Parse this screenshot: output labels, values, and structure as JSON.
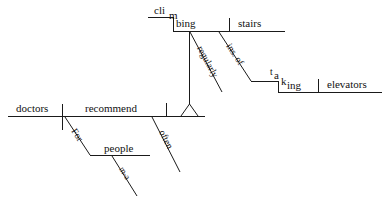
{
  "diagram": {
    "type": "reed-kellogg-sentence-diagram",
    "sentence": "Doctors often recommend climbing stairs regularly instead of taking elevators for middle-aged people.",
    "ink_color": "#1a1a1a",
    "background_color": "#ffffff",
    "main_clause": {
      "subject": "doctors",
      "verb": "recommend",
      "subject_verb_divider": "vertical-crossing-baseline"
    },
    "direct_object_phrase": {
      "gerund": {
        "prefix": "cli",
        "mid": "m",
        "suffix": "bing",
        "full": "climbing"
      },
      "object": "stairs",
      "object_divider": "vertical-on-baseline"
    },
    "modifiers": [
      {
        "id": "often",
        "label": "often",
        "attaches_to": "recommend"
      },
      {
        "id": "for",
        "label": "For",
        "attaches_to": "recommend"
      },
      {
        "id": "people",
        "label": "people",
        "attaches_to": "For"
      },
      {
        "id": "m-a",
        "label": "m-a",
        "attaches_to": "people"
      },
      {
        "id": "regularly",
        "label": "regularly",
        "attaches_to": "climbing"
      },
      {
        "id": "ins-of",
        "label": "ins. of",
        "attaches_to": "climbing"
      }
    ],
    "prepositional_object_phrase": {
      "gerund": {
        "prefix": "t",
        "mid": "a",
        "mid2": "k",
        "suffix": "ing",
        "full": "taking"
      },
      "object": "elevators",
      "object_divider": "vertical-on-baseline"
    }
  }
}
